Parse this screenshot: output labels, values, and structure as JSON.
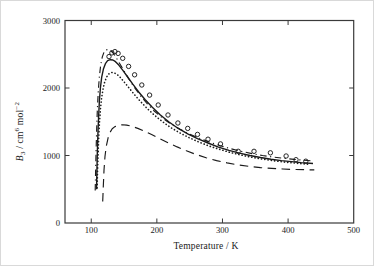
{
  "chart_data": {
    "type": "line",
    "title": "",
    "xlabel": "Temperature / K",
    "ylabel": "B3 / cm6 mol-2",
    "ylabel_parts": {
      "var": "B",
      "sub": "3",
      "unit1": " / cm",
      "sup1": "6",
      "unit2": " mol",
      "sup2": "−2"
    },
    "xlim": [
      60,
      500
    ],
    "ylim": [
      0,
      3000
    ],
    "x_ticks": [
      100,
      200,
      300,
      400,
      500
    ],
    "y_ticks": [
      0,
      1000,
      2000,
      3000
    ],
    "grid": false,
    "legend": "none",
    "colors": {
      "ink": "#1a1a1a",
      "frame": "#3a3a3a",
      "background": "#ffffff"
    },
    "series": [
      {
        "name": "dash-dot-curve",
        "style": "dashdot",
        "points": [
          [
            106,
            480
          ],
          [
            106.6,
            760
          ],
          [
            107.4,
            1080
          ],
          [
            108.3,
            1400
          ],
          [
            109.4,
            1700
          ],
          [
            110.8,
            1960
          ],
          [
            112.4,
            2170
          ],
          [
            114.4,
            2340
          ],
          [
            116.8,
            2460
          ],
          [
            119.5,
            2530
          ],
          [
            122.5,
            2565
          ],
          [
            126,
            2572
          ],
          [
            129.5,
            2555
          ],
          [
            133.5,
            2515
          ],
          [
            138,
            2450
          ],
          [
            143.5,
            2360
          ],
          [
            150,
            2250
          ],
          [
            157.5,
            2130
          ],
          [
            166,
            2005
          ],
          [
            175,
            1885
          ],
          [
            185,
            1770
          ],
          [
            196,
            1660
          ],
          [
            208,
            1560
          ],
          [
            221,
            1470
          ],
          [
            235,
            1390
          ],
          [
            250,
            1315
          ],
          [
            265,
            1255
          ],
          [
            281,
            1195
          ],
          [
            297,
            1145
          ],
          [
            313,
            1100
          ],
          [
            329,
            1060
          ],
          [
            345,
            1028
          ],
          [
            361,
            1000
          ],
          [
            377,
            978
          ],
          [
            393,
            958
          ],
          [
            409,
            942
          ],
          [
            424,
            930
          ],
          [
            438,
            920
          ]
        ]
      },
      {
        "name": "solid-curve",
        "style": "solid",
        "points": [
          [
            108,
            500
          ],
          [
            108.6,
            760
          ],
          [
            109.3,
            1030
          ],
          [
            110.2,
            1320
          ],
          [
            111.2,
            1570
          ],
          [
            112.5,
            1810
          ],
          [
            114,
            2000
          ],
          [
            116,
            2160
          ],
          [
            118.5,
            2280
          ],
          [
            121.5,
            2360
          ],
          [
            125,
            2405
          ],
          [
            129,
            2420
          ],
          [
            133,
            2415
          ],
          [
            137,
            2390
          ],
          [
            142,
            2340
          ],
          [
            148,
            2265
          ],
          [
            155,
            2170
          ],
          [
            163,
            2060
          ],
          [
            172,
            1945
          ],
          [
            182,
            1830
          ],
          [
            193,
            1715
          ],
          [
            205,
            1605
          ],
          [
            218,
            1500
          ],
          [
            232,
            1405
          ],
          [
            247,
            1320
          ],
          [
            262,
            1250
          ],
          [
            278,
            1185
          ],
          [
            294,
            1125
          ],
          [
            310,
            1075
          ],
          [
            326,
            1035
          ],
          [
            342,
            1000
          ],
          [
            358,
            970
          ],
          [
            374,
            945
          ],
          [
            390,
            925
          ],
          [
            405,
            910
          ],
          [
            420,
            895
          ],
          [
            438,
            882
          ]
        ]
      },
      {
        "name": "dotted-curve",
        "style": "dotted",
        "points": [
          [
            109,
            520
          ],
          [
            109.6,
            750
          ],
          [
            110.4,
            1000
          ],
          [
            111.4,
            1260
          ],
          [
            112.6,
            1490
          ],
          [
            114,
            1680
          ],
          [
            115.8,
            1850
          ],
          [
            118,
            1990
          ],
          [
            120.5,
            2090
          ],
          [
            123.5,
            2165
          ],
          [
            127,
            2210
          ],
          [
            131,
            2230
          ],
          [
            135,
            2225
          ],
          [
            139.5,
            2200
          ],
          [
            145,
            2150
          ],
          [
            151,
            2080
          ],
          [
            158,
            1995
          ],
          [
            166,
            1900
          ],
          [
            175,
            1800
          ],
          [
            185,
            1700
          ],
          [
            196,
            1600
          ],
          [
            208,
            1505
          ],
          [
            221,
            1415
          ],
          [
            235,
            1335
          ],
          [
            249,
            1265
          ],
          [
            264,
            1200
          ],
          [
            280,
            1140
          ],
          [
            296,
            1090
          ],
          [
            312,
            1045
          ],
          [
            328,
            1008
          ],
          [
            344,
            975
          ],
          [
            360,
            948
          ],
          [
            376,
            925
          ],
          [
            392,
            905
          ],
          [
            407,
            890
          ],
          [
            421,
            878
          ],
          [
            434,
            868
          ]
        ]
      },
      {
        "name": "long-dash-curve",
        "style": "longdash",
        "points": [
          [
            117.5,
            320
          ],
          [
            118.3,
            540
          ],
          [
            119.5,
            780
          ],
          [
            121,
            990
          ],
          [
            123,
            1140
          ],
          [
            125.5,
            1255
          ],
          [
            128.5,
            1340
          ],
          [
            132,
            1395
          ],
          [
            136,
            1428
          ],
          [
            141,
            1448
          ],
          [
            147,
            1455
          ],
          [
            154,
            1450
          ],
          [
            162,
            1432
          ],
          [
            171,
            1402
          ],
          [
            181,
            1360
          ],
          [
            192,
            1310
          ],
          [
            204,
            1252
          ],
          [
            217,
            1190
          ],
          [
            231,
            1128
          ],
          [
            245,
            1070
          ],
          [
            260,
            1015
          ],
          [
            275,
            967
          ],
          [
            291,
            925
          ],
          [
            307,
            890
          ],
          [
            324,
            860
          ],
          [
            341,
            838
          ],
          [
            358,
            821
          ],
          [
            375,
            809
          ],
          [
            392,
            800
          ],
          [
            409,
            793
          ],
          [
            425,
            789
          ],
          [
            440,
            786
          ]
        ]
      },
      {
        "name": "experimental-points",
        "style": "scatter-open-circle",
        "points": [
          [
            127,
            2465
          ],
          [
            131.5,
            2520
          ],
          [
            136,
            2540
          ],
          [
            141,
            2512
          ],
          [
            148,
            2440
          ],
          [
            157,
            2320
          ],
          [
            166,
            2195
          ],
          [
            177,
            2045
          ],
          [
            189,
            1895
          ],
          [
            202,
            1748
          ],
          [
            217,
            1600
          ],
          [
            232,
            1482
          ],
          [
            247,
            1402
          ],
          [
            262,
            1312
          ],
          [
            278,
            1242
          ],
          [
            297,
            1172
          ],
          [
            324,
            1062
          ],
          [
            348,
            1062
          ],
          [
            373,
            1040
          ],
          [
            397,
            992
          ],
          [
            412,
            938
          ],
          [
            427,
            916
          ]
        ]
      }
    ]
  }
}
